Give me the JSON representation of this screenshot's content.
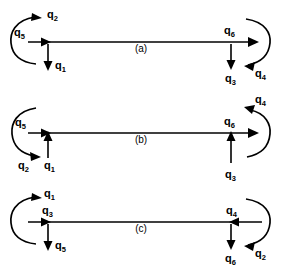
{
  "figure": {
    "title": "",
    "background_color": "#ffffff",
    "stroke_color": "#000000",
    "panels": [
      {
        "id": "a",
        "caption": "(a)",
        "axis_y": 42,
        "line": {
          "x1": 28,
          "x2": 252,
          "arrowhead": "right",
          "arrowhead_label": "q6"
        },
        "mid_arrowhead_label": "q2_inner",
        "left_arc": {
          "label": "q5",
          "orientation": "opens-right",
          "arrowhead_at": "top",
          "arrowhead_direction": "right",
          "arrowhead_label": "q2"
        },
        "right_arc": {
          "label": "",
          "orientation": "opens-left",
          "arrowhead_at": "bottom",
          "arrowhead_direction": "left",
          "arrowhead_label": "q4"
        },
        "left_vertical": {
          "label": "q1",
          "direction": "down"
        },
        "right_vertical": {
          "label": "q3",
          "direction": "down"
        },
        "labels": [
          "q2",
          "q5",
          "q1",
          "q6",
          "q3",
          "q4"
        ]
      },
      {
        "id": "b",
        "caption": "(b)",
        "axis_y": 133,
        "line": {
          "x1": 28,
          "x2": 252,
          "arrowhead": "right",
          "arrowhead_label": "q6"
        },
        "left_arc": {
          "label": "q5",
          "orientation": "opens-right",
          "arrowhead_at": "bottom",
          "arrowhead_direction": "right",
          "arrowhead_label": "q2"
        },
        "right_arc": {
          "label": "",
          "orientation": "opens-left",
          "arrowhead_at": "top",
          "arrowhead_direction": "left",
          "arrowhead_label": "q4"
        },
        "left_vertical": {
          "label": "q1",
          "direction": "up"
        },
        "right_vertical": {
          "label": "q3",
          "direction": "up"
        },
        "labels": [
          "q5",
          "q2",
          "q1",
          "q6",
          "q3",
          "q4"
        ]
      },
      {
        "id": "c",
        "caption": "(c)",
        "axis_y": 222,
        "line": {
          "x1": 28,
          "x2": 260,
          "arrowhead": "both-inward",
          "arrowhead_label": "q3"
        },
        "left_arc": {
          "label": "",
          "orientation": "opens-right",
          "arrowhead_at": "top",
          "arrowhead_direction": "right",
          "arrowhead_label": "q1"
        },
        "right_arc": {
          "label": "",
          "orientation": "opens-left",
          "arrowhead_at": "bottom",
          "arrowhead_direction": "left",
          "arrowhead_label": "q2"
        },
        "left_vertical": {
          "label": "q5",
          "direction": "down"
        },
        "right_vertical": {
          "label": "q6",
          "direction": "down"
        },
        "labels": [
          "q1",
          "q3",
          "q5",
          "q4",
          "q6",
          "q2"
        ]
      }
    ]
  },
  "labels": {
    "q_base": "q",
    "a": {
      "arc_left_top": {
        "base": "q",
        "sub": "2"
      },
      "arc_left_name": {
        "base": "q",
        "sub": "5"
      },
      "vert_left": {
        "base": "q",
        "sub": "1"
      },
      "line": {
        "base": "q",
        "sub": "6"
      },
      "vert_right": {
        "base": "q",
        "sub": "3"
      },
      "arc_right": {
        "base": "q",
        "sub": "4"
      },
      "caption": "(a)"
    },
    "b": {
      "arc_left_name": {
        "base": "q",
        "sub": "5"
      },
      "arc_left_bottom": {
        "base": "q",
        "sub": "2"
      },
      "vert_left": {
        "base": "q",
        "sub": "1"
      },
      "line": {
        "base": "q",
        "sub": "6"
      },
      "vert_right": {
        "base": "q",
        "sub": "3"
      },
      "arc_right": {
        "base": "q",
        "sub": "4"
      },
      "caption": "(b)"
    },
    "c": {
      "arc_left_top": {
        "base": "q",
        "sub": "1"
      },
      "line_left": {
        "base": "q",
        "sub": "3"
      },
      "vert_left": {
        "base": "q",
        "sub": "5"
      },
      "line_right": {
        "base": "q",
        "sub": "4"
      },
      "vert_right": {
        "base": "q",
        "sub": "6"
      },
      "arc_right": {
        "base": "q",
        "sub": "2"
      },
      "caption": "(c)"
    }
  }
}
